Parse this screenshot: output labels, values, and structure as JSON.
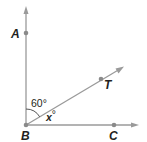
{
  "diagram": {
    "type": "angle-figure",
    "vertex": {
      "label": "B",
      "x": 26,
      "y": 125
    },
    "rays": [
      {
        "id": "BA",
        "point_label": "A",
        "point": {
          "x": 26,
          "y": 33
        },
        "tip": {
          "x": 26,
          "y": 8
        }
      },
      {
        "id": "BT",
        "point_label": "T",
        "point": {
          "x": 101,
          "y": 79
        },
        "tip": {
          "x": 123,
          "y": 67
        }
      },
      {
        "id": "BC",
        "point_label": "C",
        "point": {
          "x": 114,
          "y": 125
        },
        "tip": {
          "x": 137,
          "y": 125
        }
      }
    ],
    "angles": [
      {
        "between": [
          "BA",
          "BT"
        ],
        "label": "60°"
      },
      {
        "between": [
          "BT",
          "BC"
        ],
        "label": "x°"
      }
    ],
    "colors": {
      "ray": "#9a9a9a",
      "point": "#8a8a8a",
      "arc": "#555555",
      "text": "#231f20"
    }
  },
  "labels": {
    "A": "A",
    "B": "B",
    "C": "C",
    "T": "T",
    "angle_ABT": "60°",
    "angle_TBC_var": "x",
    "angle_TBC_deg": "°"
  }
}
